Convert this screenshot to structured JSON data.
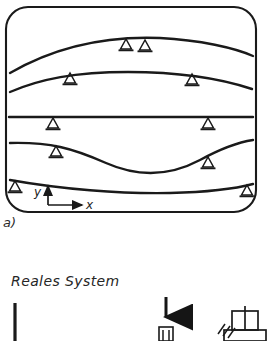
{
  "figure": {
    "panel_label": "a)",
    "section_heading": "Reales System",
    "axes": {
      "x_label": "x",
      "y_label": "y",
      "origin_x": 48,
      "origin_y": 205
    },
    "frame": {
      "x": 6,
      "y": 7,
      "width": 250,
      "height": 205,
      "corner_radius": 22,
      "stroke": "#1a1a1a",
      "stroke_width": 2.1
    },
    "colors": {
      "ink": "#1a1a1a",
      "ink_soft": "#2a2a2a",
      "background": "#ffffff"
    },
    "mode_shapes": [
      {
        "name": "mode-1-hump",
        "description": "single hump rising to a crest near mid span",
        "path": "M 10,73 C 60,44 110,36 160,38 C 200,40 235,48 253,56",
        "supports": [
          {
            "x": 126,
            "y": 39
          },
          {
            "x": 145,
            "y": 40
          }
        ]
      },
      {
        "name": "mode-2-arch",
        "description": "flattened arch with two supports",
        "path": "M 10,92 C 40,79 75,72 128,72 C 180,72 222,79 252,89",
        "supports": [
          {
            "x": 70,
            "y": 73
          },
          {
            "x": 192,
            "y": 74
          }
        ]
      },
      {
        "name": "mode-3-straight",
        "description": "straight horizontal line with two supports",
        "path": "M 9,117 L 253,117",
        "supports": [
          {
            "x": 53,
            "y": 117
          },
          {
            "x": 208,
            "y": 117
          }
        ]
      },
      {
        "name": "mode-4-wave",
        "description": "wave dipping down through mid span",
        "path": "M 10,143 C 50,142 72,148 106,163 C 140,178 170,176 200,160 C 222,148 240,142 253,140",
        "supports": [
          {
            "x": 56,
            "y": 146
          },
          {
            "x": 208,
            "y": 157
          }
        ]
      },
      {
        "name": "mode-5-sag",
        "description": "shallow sagging curve near the base",
        "path": "M 10,180 C 60,189 120,194 170,193 C 210,192 238,188 253,184",
        "supports": [
          {
            "x": 15,
            "y": 181
          },
          {
            "x": 247,
            "y": 185
          }
        ]
      }
    ],
    "real_system": {
      "column": {
        "name": "vertical-bar",
        "x": 15,
        "y_top": 303,
        "y_bottom": 341
      },
      "load": {
        "name": "downward-force-arrow",
        "x": 166,
        "y_top": 298,
        "y_tip": 325
      },
      "clamp": {
        "name": "clamp-fixture",
        "x": 166,
        "y": 326
      },
      "hatching": {
        "name": "ground-hatch",
        "x": 222,
        "y": 324
      },
      "block": {
        "name": "block-support",
        "x": 244,
        "y": 312
      }
    }
  }
}
